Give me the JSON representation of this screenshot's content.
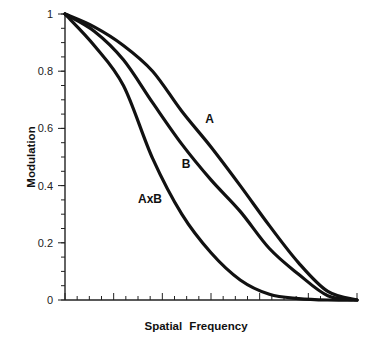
{
  "chart_data": {
    "type": "line",
    "title": "",
    "xlabel": "Spatial Frequency",
    "ylabel": "Modulation",
    "xlim": [
      0,
      1
    ],
    "ylim": [
      0,
      1
    ],
    "x_tick_labels": [],
    "x_major_ticks": 6,
    "x_minor_per_major": 4,
    "y_ticks": [
      0,
      0.2,
      0.4,
      0.6,
      0.8,
      1
    ],
    "y_tick_labels": [
      "0",
      "0.2",
      "0.4",
      "0.6",
      "0.8",
      "1"
    ],
    "y_minor_step": 0.05,
    "grid": false,
    "legend": "inline labels",
    "x": [
      0,
      0.1,
      0.2,
      0.3,
      0.4,
      0.5,
      0.6,
      0.7,
      0.8,
      0.9,
      1.0
    ],
    "series": [
      {
        "name": "A",
        "values": [
          1.0,
          0.955,
          0.89,
          0.8,
          0.66,
          0.535,
          0.4,
          0.26,
          0.13,
          0.03,
          0.0
        ]
      },
      {
        "name": "B",
        "values": [
          1.0,
          0.94,
          0.84,
          0.69,
          0.545,
          0.42,
          0.31,
          0.18,
          0.09,
          0.015,
          0.0
        ]
      },
      {
        "name": "AxB",
        "values": [
          1.0,
          0.89,
          0.75,
          0.495,
          0.3,
          0.165,
          0.07,
          0.02,
          0.005,
          0.0,
          0.0
        ]
      }
    ],
    "annotations": [
      {
        "text": "A",
        "x": 0.48,
        "y": 0.62
      },
      {
        "text": "B",
        "x": 0.4,
        "y": 0.46
      },
      {
        "text": "AxB",
        "x": 0.25,
        "y": 0.34
      }
    ]
  },
  "labels": {
    "ylabel": "Modulation",
    "xlabel": "Spatial Frequency",
    "curve_a": "A",
    "curve_b": "B",
    "curve_axb": "AxB"
  }
}
